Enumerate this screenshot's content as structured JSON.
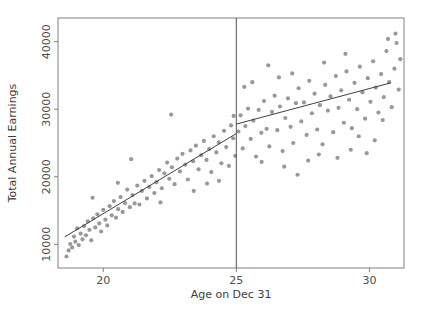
{
  "chart_data": {
    "type": "scatter",
    "title": "",
    "subtitle": "",
    "xlabel": "Age on Dec 31",
    "ylabel": "Total Annual Earnings",
    "xlim": [
      18.3,
      31.3
    ],
    "ylim": [
      6500,
      43500
    ],
    "xticks": [
      20,
      25,
      30
    ],
    "xticklabels": [
      "20",
      "25",
      "30"
    ],
    "yticks": [
      10000,
      20000,
      30000,
      40000
    ],
    "yticklabels": [
      "10000",
      "20000",
      "30000",
      "40000"
    ],
    "grid": false,
    "legend": null,
    "point_color": "#999999",
    "line_color": "#404040",
    "cutoff_line_color": "#555555",
    "axis_color": "#808080",
    "marker_size": 2.1,
    "cutoff": 25,
    "annotations": [
      {
        "name": "cutoff-line",
        "x": 25,
        "note": "vertical reference line at Age 25"
      },
      {
        "name": "fit-left",
        "note": "linear fit below cutoff"
      },
      {
        "name": "fit-right",
        "note": "linear fit above cutoff, discontinuous jump at 25"
      }
    ],
    "fit_left": {
      "x": [
        18.55,
        25.0
      ],
      "y": [
        11100,
        26400
      ]
    },
    "fit_right": {
      "x": [
        25.0,
        30.8
      ],
      "y": [
        27800,
        33900
      ]
    },
    "points": [
      [
        18.62,
        8200
      ],
      [
        18.7,
        9100
      ],
      [
        18.76,
        10050
      ],
      [
        18.83,
        9550
      ],
      [
        18.9,
        11150
      ],
      [
        18.95,
        10400
      ],
      [
        19.02,
        12350
      ],
      [
        19.08,
        9900
      ],
      [
        19.15,
        11600
      ],
      [
        19.22,
        10750
      ],
      [
        19.28,
        12700
      ],
      [
        19.35,
        11350
      ],
      [
        19.42,
        13400
      ],
      [
        19.48,
        12150
      ],
      [
        19.55,
        10600
      ],
      [
        19.62,
        13850
      ],
      [
        19.7,
        12500
      ],
      [
        19.78,
        14450
      ],
      [
        19.85,
        13100
      ],
      [
        19.92,
        11900
      ],
      [
        20.0,
        15100
      ],
      [
        20.08,
        13650
      ],
      [
        20.15,
        12800
      ],
      [
        20.24,
        15650
      ],
      [
        20.32,
        14300
      ],
      [
        20.4,
        16400
      ],
      [
        20.48,
        13950
      ],
      [
        20.56,
        15200
      ],
      [
        20.65,
        17000
      ],
      [
        20.73,
        14800
      ],
      [
        20.82,
        16100
      ],
      [
        20.9,
        18100
      ],
      [
        21.0,
        15500
      ],
      [
        21.1,
        17300
      ],
      [
        21.18,
        16050
      ],
      [
        21.28,
        18700
      ],
      [
        21.36,
        15900
      ],
      [
        21.45,
        17900
      ],
      [
        21.55,
        19400
      ],
      [
        21.64,
        16800
      ],
      [
        21.73,
        18500
      ],
      [
        21.82,
        20100
      ],
      [
        21.92,
        17600
      ],
      [
        22.0,
        19200
      ],
      [
        22.1,
        21000
      ],
      [
        22.2,
        18300
      ],
      [
        22.3,
        20500
      ],
      [
        22.4,
        22100
      ],
      [
        22.48,
        19700
      ],
      [
        22.58,
        21400
      ],
      [
        22.68,
        18900
      ],
      [
        22.78,
        22700
      ],
      [
        22.88,
        20800
      ],
      [
        22.98,
        23400
      ],
      [
        23.08,
        21800
      ],
      [
        23.18,
        19600
      ],
      [
        23.28,
        23900
      ],
      [
        23.38,
        22300
      ],
      [
        23.48,
        24600
      ],
      [
        23.58,
        21100
      ],
      [
        23.68,
        23200
      ],
      [
        23.78,
        25300
      ],
      [
        23.88,
        22500
      ],
      [
        23.98,
        24100
      ],
      [
        24.06,
        20700
      ],
      [
        24.15,
        26000
      ],
      [
        24.25,
        23600
      ],
      [
        24.34,
        25100
      ],
      [
        24.44,
        22000
      ],
      [
        24.54,
        26800
      ],
      [
        24.62,
        24400
      ],
      [
        24.72,
        21600
      ],
      [
        24.8,
        27600
      ],
      [
        24.88,
        25700
      ],
      [
        24.96,
        23100
      ],
      [
        22.55,
        29200
      ],
      [
        23.4,
        17900
      ],
      [
        21.05,
        22600
      ],
      [
        24.35,
        19400
      ],
      [
        20.55,
        19100
      ],
      [
        19.6,
        16900
      ],
      [
        23.9,
        19000
      ],
      [
        22.15,
        16200
      ],
      [
        24.9,
        29000
      ],
      [
        25.08,
        26700
      ],
      [
        25.16,
        29100
      ],
      [
        25.24,
        24200
      ],
      [
        25.34,
        27500
      ],
      [
        25.44,
        30100
      ],
      [
        25.54,
        25600
      ],
      [
        25.64,
        28300
      ],
      [
        25.74,
        23000
      ],
      [
        25.84,
        29900
      ],
      [
        25.94,
        26500
      ],
      [
        26.04,
        31200
      ],
      [
        26.14,
        27100
      ],
      [
        26.24,
        24500
      ],
      [
        26.34,
        29600
      ],
      [
        26.44,
        32000
      ],
      [
        26.54,
        26900
      ],
      [
        26.64,
        30400
      ],
      [
        26.74,
        23800
      ],
      [
        26.84,
        28700
      ],
      [
        26.94,
        31600
      ],
      [
        27.04,
        27400
      ],
      [
        27.14,
        25000
      ],
      [
        27.24,
        30900
      ],
      [
        27.34,
        33100
      ],
      [
        27.44,
        28200
      ],
      [
        27.54,
        31000
      ],
      [
        27.64,
        26200
      ],
      [
        27.74,
        34200
      ],
      [
        27.84,
        29400
      ],
      [
        27.94,
        32300
      ],
      [
        28.04,
        27000
      ],
      [
        28.14,
        30600
      ],
      [
        28.24,
        24800
      ],
      [
        28.34,
        33600
      ],
      [
        28.44,
        29800
      ],
      [
        28.54,
        31900
      ],
      [
        28.64,
        26600
      ],
      [
        28.74,
        34900
      ],
      [
        28.84,
        30200
      ],
      [
        28.94,
        32800
      ],
      [
        29.04,
        28000
      ],
      [
        29.14,
        35600
      ],
      [
        29.24,
        31400
      ],
      [
        29.34,
        27200
      ],
      [
        29.44,
        33900
      ],
      [
        29.54,
        30000
      ],
      [
        29.64,
        36300
      ],
      [
        29.74,
        32500
      ],
      [
        29.84,
        28600
      ],
      [
        29.94,
        34600
      ],
      [
        30.04,
        31100
      ],
      [
        30.14,
        37100
      ],
      [
        30.24,
        33200
      ],
      [
        30.34,
        29500
      ],
      [
        30.44,
        35200
      ],
      [
        30.54,
        31800
      ],
      [
        30.64,
        38600
      ],
      [
        30.74,
        34000
      ],
      [
        30.84,
        30300
      ],
      [
        30.94,
        36000
      ],
      [
        31.02,
        39800
      ],
      [
        31.1,
        32900
      ],
      [
        31.16,
        37400
      ],
      [
        30.98,
        41200
      ],
      [
        30.7,
        40400
      ],
      [
        26.2,
        36500
      ],
      [
        27.1,
        35300
      ],
      [
        28.3,
        36900
      ],
      [
        29.1,
        38200
      ],
      [
        25.6,
        34000
      ],
      [
        26.8,
        21500
      ],
      [
        27.7,
        22400
      ],
      [
        28.8,
        22800
      ],
      [
        29.9,
        23500
      ],
      [
        25.3,
        33300
      ],
      [
        30.2,
        25400
      ],
      [
        29.6,
        26000
      ],
      [
        28.1,
        23300
      ],
      [
        26.6,
        34700
      ],
      [
        27.3,
        20300
      ],
      [
        25.95,
        22200
      ],
      [
        29.3,
        24000
      ],
      [
        30.5,
        28400
      ]
    ]
  }
}
